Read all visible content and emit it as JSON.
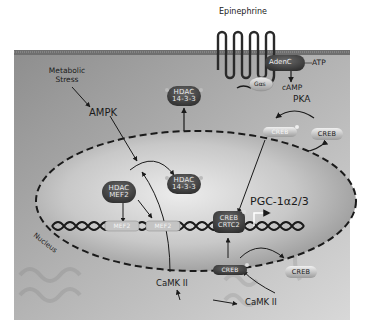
{
  "diagram": {
    "extracellular": {
      "ligand": "Epinephrine"
    },
    "membrane": {
      "receptor_g_protein": "Gαs",
      "adenylate_cyclase": "AdenC",
      "substrate": "ATP",
      "second_messenger": "cAMP",
      "kinase": "PKA"
    },
    "cytoplasm": {
      "stimulus": "Metabolic Stress",
      "ampk": "AMPK",
      "creb_phospho": "CREB",
      "creb_free": "CREB",
      "creb_lower_phospho": "CREB",
      "creb_lower_free": "CREB",
      "camk_left": "CaMK II",
      "camk_right": "CaMK II",
      "hdac_cyto": {
        "line1": "HDAC",
        "line2": "14-3-3"
      }
    },
    "nucleus": {
      "label": "Nucleus",
      "hdac_1433": {
        "line1": "HDAC",
        "line2": "14-3-3"
      },
      "hdac_mef2": {
        "line1": "HDAC",
        "line2": "MEF2"
      },
      "mef2_left": "MEF2",
      "mef2_right": "MEF2",
      "creb_crtc2": {
        "line1": "CREB",
        "line2": "CRTC2"
      },
      "target_gene": "PGC-1α2/3"
    }
  }
}
